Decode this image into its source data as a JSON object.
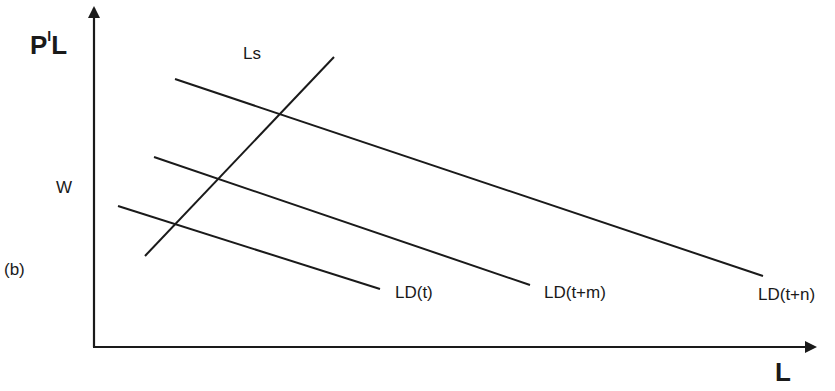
{
  "diagram": {
    "panel_label": "(b)",
    "y_axis_label": {
      "main": "P",
      "sup": "I",
      "tail": "L"
    },
    "x_axis_label": "L",
    "wage_label": "W",
    "supply_curve_label": "Ls",
    "demand_curves": [
      {
        "label": "LD(t)"
      },
      {
        "label": "LD(t+m)"
      },
      {
        "label": "LD(t+n)"
      }
    ],
    "line_color": "#1a1a1a"
  }
}
